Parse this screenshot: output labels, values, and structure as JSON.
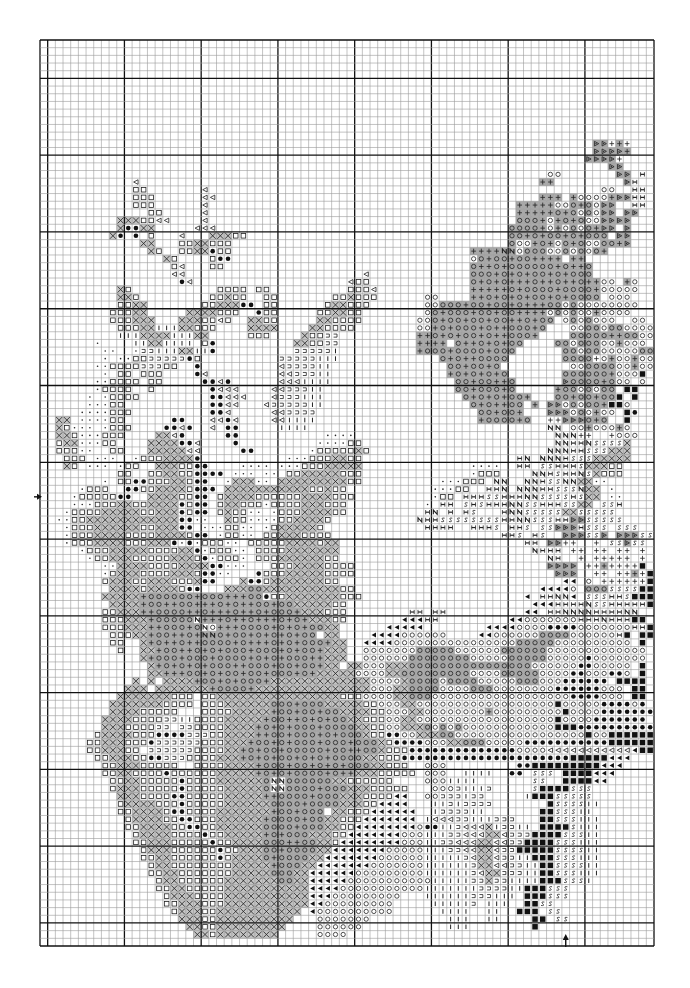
{
  "page": {
    "background": "#ffffff"
  },
  "chart_data": {
    "type": "cross-stitch-grid",
    "columns": 80,
    "rows_count": 118,
    "major_every": 10,
    "first_major_col_offset": 1,
    "first_major_row_offset": 5,
    "center_markers": [
      {
        "side": "left",
        "direction": "right",
        "row": 59
      },
      {
        "side": "bottom",
        "direction": "up",
        "col": 68
      }
    ],
    "colors": {
      "grid_minor": "#9a9a9a",
      "grid_major": "#111111",
      "shade": "#a8a8a8",
      "ink": "#222222"
    },
    "legend": {
      ".": {
        "symbol": "empty",
        "shaded": false
      },
      "x": {
        "symbol": "x-in-box",
        "shaded": true
      },
      "q": {
        "symbol": "open-square",
        "shaded": false
      },
      "d": {
        "symbol": "left-triangle-outline",
        "shaded": false
      },
      "b": {
        "symbol": "filled-dot",
        "shaded": false
      },
      "o": {
        "symbol": "open-circle",
        "shaded": false
      },
      "O": {
        "symbol": "open-circle",
        "shaded": true
      },
      "+": {
        "symbol": "plus",
        "shaded": true
      },
      "p": {
        "symbol": "plus",
        "shaded": false
      },
      "n": {
        "symbol": "letter-N",
        "shaded": false
      },
      "N": {
        "symbol": "letter-N",
        "shaded": true
      },
      "s": {
        "symbol": "letter-S",
        "shaded": false
      },
      "t": {
        "symbol": "small-dot",
        "shaded": false
      },
      "i": {
        "symbol": "vertical-bar",
        "shaded": false
      },
      "c": {
        "symbol": "hook",
        "shaded": false
      },
      "e": {
        "symbol": "filled-left-triangle",
        "shaded": false
      },
      "m": {
        "symbol": "filled-square",
        "shaded": false
      },
      "D": {
        "symbol": "right-triangle-dot",
        "shaded": true
      },
      "h": {
        "symbol": "letter-H",
        "shaded": false
      }
    },
    "rows": [
      "................................................................................",
      "................................................................................",
      "................................................................................",
      "................................................................................",
      "................................................................................",
      "................................................................................",
      "................................................................................",
      "................................................................................",
      "................................................................................",
      "................................................................................",
      "................................................................................",
      "................................................................................",
      "................................................................................",
      "........................................................................DDp+p...",
      "........................................................................DDDD+...",
      ".......................................................................DDDDp....",
      "..........................................................................DD....",
      "..................................................................oo.......DD.h.",
      "............d....................................................++.........Dh.",
      "............qq.......d...................................................oo..hh.",
      "............qqq......dd..........................................+++.+oooo+DDhh",
      "............qqq......d........................................+++++ooO+OoDD..hh",
      "..............qq.....d........................................+++++O+OoOoDD.DD.",
      "..........xxxqqdd....d........................................OOO+o+O+OooDDDD..",
      "..........xbbxx.....ddd......................................OOOO+o+oOoO+DD.D..",
      ".........xb.b.q...d...xxxqq..................................OO+O+OO+O+OOO.DD..",
      ".............xx...qqxxqqq....................................Ooo+O+oO+OooOO+D..",
      "..............xq..qqxxbqq...............................++++NNoOOOooOoOoO+...",
      "................xq....qbb...............................oO+OO+OO++++.++........",
      ".................qd...qq................................O++O+OOOOOO+O++O.......",
      ".................dd.......................d.............OOO+O+O+OO+O+OOO.......",
      "..................bd....................dqq.............O+O+O+++O++O++O++oo.+o.",
      "..........xq...........qqqq.qq..........qqqd............+++++O+OOOO+OOOO+ooooo..",
      "..........xxq.........qqxqq..qq.......qqxqqq......oo....++O+O+O+OO+O+OOOO.ooo...",
      "..........qqxx.......qqxxxbb.qq......qxxqqq.......ooOOO+OO+OO+O+++OOoOoooooooo..",
      ".........qqqxx.....xxxxqqq..bqq.....qqxxqq........oO+OOO+OO+OO++++oOoOoo+oooo...",
      ".........qqqxxx...xxxqqdq..xxqq.....xxqqqq.......ooO+OO+OO+OO++O+OO.oOoOooo..oo.",
      "..........qqqxxiiixxqqq....xxxx....xxqqqq........oo+O+OOO+O++OOO+O...ooOOoOOoooo",
      "..........iiixxxxiiixx.....qqq....xqqcc..........++O+O+OO+O++OOO+....OOOOO++OOoo",
      ".......t....iixxiiii.qb..........xxqqcc..........++++.O++O+O+OO....OOoOOOoo+ooo",
      "........tt..tcciiixxiib..........ccccci..........+OOO+OOOO+OOO......OOoOOoooooOO",
      "........t.ttqqcccccbq..........ccccciii.............O+O++OOOO.......OOOOpo+oo+oo",
      ".......ttqqqqcccqq..b..........dccccii...............OO+OO+O.........ooOOOOoo+oo",
      "........t.qq.qqq....bd.........ddcccii...............+O+O+O+O.......OOOOOO+ooom",
      ".......ttqqqq.qq.....bbdb......dddiiii................OO+OO++O......DOOOO+Ooo.o",
      ".......tqqqq..q.......bddd....ddcccii.................OO+OOO+O.....+OOoOoOO.mm",
      "......t.tqqqq.........bbddd...dccciii..................O+O+O+OO+...OO+OO+OOm.m",
      "......tttqq...........bbdd...dcccccii...................O+O++OO.+.DDoOoOO+mmo",
      ".....ttttqqq..........bbd.....ddcccc.....................OO+OO+...DDDoOo+oo.mb",
      "..xx.ttttqq......bb...ddbd....ddiiii.....................+OOOO+O..ppDDDO+O..m.",
      "..xqttt.tqqq....bbdb..d.bb.....iiii...............................nn.oo+ooo+o",
      "..xxqtttqqq....xxdb.....bb...........tttt..........................nnnpp..pooo",
      "..qxxtttqq....xxxxbbd....b..........ttttqq.........................nnhhnssssx",
      "..qqqtt..qq...xxxxxdd.....bb.......tqqqqqxq.......................nnnhhsssxxx",
      "...qqq.ttt..tqqqxxxxb...........tttqqqxxqq....................hn.nnnhsssxxxxx",
      "...xq.ttt.tqq..xxxqqbb....tttt.tttqqqxxxxx..............tttt..hh.sshhhsxxxqq",
      "..........qq..qqxxqqbbbb.ttt.tt.qqxxxxxqqq..............tqqq....nnhshhnsxqqq.",
      "........t.qqbbqqqxxqbb..txxxtt.xxxxxxxxxqq..........tttqqq.nn..nnhssnnxxtt.",
      ".....tqqq..bbqqxxxxqbbb.xxxxxxxxxxxqqxqq...........tttqq..hhn.nnnhhsssnxx.t",
      "....tqqqqqbb..xxxxqqbb.qxxxxqqqqqqxxxxqqq..........tqq.hhhsshhhnnsssshsxx.tt",
      "....tttqqqxxqqxxxxbqbb.qxxqqqtqqqqxxxqqq..........t.hh.shshhhnnsshhhssxx.ssh",
      "...tqqqqxxxxxqqxxxbqbb.qxqqtt.tqqqxxxxqq..........hn.h.hs...hnnsssssxxsssss",
      "..ttqqxxxxxxxxxxxxbbtt..xqqttttqqxxxxq...........nhhsssssssshhnnssshhDDsssss",
      "...tqqqxxxxxxqqxxxbb.tttqqtt.tqxxxxxq.............hhhh..hhhs.hhs.ssDDDhsss.sss",
      "...tqqqxxxxqqqqxxxxqbb.tqqtt.qqxxxqqqq......................hhs.hs..DDDssD.DDDss",
      "...tqqqxxxxqqqxxxbtbtqqqtt.qqqqqxxxxqxx........................hh.DDpp..p.ssDss",
      ".....tqqqxxxxxqqqqxxbtqqqtt.qqqqxxxxxxx.........................nhhh.pp.pp.pp.p",
      "......tqqxxxqqqqqxxxqbtqqqt.qqqxxxxxxqq...........................nh..p.ppppp.p",
      "........ttxxxxqqqqxxxxbbttt...qqqxxxxqqqq.........................DDDD.pp+ppppm",
      "........tqxxxqqqqxxxqbbtt...bqqqxxxxxqqqq..........................DDD..pp.pp+pm",
      "........qxxxqqxxxqqqxbb...xbbqxxxxxxxqq.............................ee.o.ppppppm",
      ".........xxxxqxxxxqbb...xxxOOxxxxxxxxxxqq........................eeeeo.OOOssssmm",
      "........xxxxx+OOOOOO+OOO+++OObqqxxxxxxxqqq.....................e.hhnne.ssshhsmmm",
      ".........xxxx+OO++OO+++O+O++OO+OOxxxxxqq........................eeehhhhnsshhhhhm",
      "........qqxxx++OOOO++O+++O++O+OOO+xxxqqq........hh.hh..........ee.hhnnnnhhhhnn",
      "........qqqxxx+OOOOOn+++O++O+++O+O+xxxqq.......eeehh.........eeooooooohhhnhhhmm",
      "........qqqxxx++OOO+Ono+++OOOO+O+O+OOxx......eeeee........eeeeoooobbbbooooooohhmm",
      ".........qqqxx+OO++O+NNO+OO+O+O+O+OO.xx....eeeeoooooo....eeooooooOOOOoooooohm.mm",
      ".........qq..x+O++O++OOOO+O+++O+O+OOO+xx..eeeeooooooooooooooooOOOOOoooooooooo.m",
      "..........q..xx+OO++O+O+OOO+OOO+O+OO+xxx..oooooooOOOOOooooooOOOOOOooooooooooooo",
      ".............x+OOO+OOO+OOOO+O+O+OOO++xxx..ooooooOOOOOOOOoooooOOOOOooooobooooooo",
      "..............x+O+O+O+OOO++OOO+OO+OO+xx.xxoooxxxOOOOOOOOOOOOOOOOoooooobbooooo.m",
      "..............xx+++OO+O+OO+OO+OOO+O+xxxxxooooxxOOOOOOOOOooooOOOOOoooobbooobbo.m",
      "............x.x.xxxx+OO+O+OOO+xxxxxxxxxxxxxooooxOOOOoOOOOoooooOOOooobbbbbb.mmmm",
      "...........xxx.xxxxxxx+OOOO+xxxxxxxxxxxxxxxoooxxOOOOooooOOOoooooooobbbbbbooo.mm",
      "..........xxxxxxxqqq.qqxxxxxxxxxxxxxxxxqqqooooxxOOOoooooooooooooooooobbbbooo.mm",
      ".........xxxxxxxqqqq.qqqxxxxxxOOO+OOOxxxxxqqoooxxoooooooooooooooooomooooobbbbob",
      ".........xxxxqqqqq...qqqqxxxxx+OO+OO+OOxxxxqqoooxxoooooooo+ooooooooomoooobbbbbbb",
      "........xxxxqqqqcciiqqqqxxxxx+OO++O+O+OOxxqqqooxxoooooooooooooooooomoooobbbbbbb",
      "........xxxqqqqcc.ccqqqqxxxx+O+O+OOO+OOOOxxqqooxxxOoOoOoooooooooooommmbbbbbbbbbb",
      ".......qxxxxqqqbbbbcccqqxxxx++OO+OOO+O+OOOxqqbbooxxxOOooooooooooooooooomoommmmmmm",
      "......qqxxxqqqbccccccqqqxxx+OO+O+OOO+OOO+OOOxqbbbboooxxOOOooooobbbbbbbbbbbmmmmmmm",
      "......qqxxxqq.ccccccqqqqxx+O+OO+OOOOO+OO++OOxqqqbbbbbbbbbbbbbboooodddddddddddemm",
      ".......qqxxxqqbbcccqqqqxxx+O+O+OO+O+O+OOOOxxqqqbbbbbbbbbbbbbbbbbbbbbbmmmmmeee",
      "........qqxxxqqqqq..qqqqxxxx+OOO+OO+O+O+OOOxxqqq..ooo.........bbmmmmmmmmmeee",
      "........qqxxqqqqbqqqqqqxxxxx+O+O+OOOO+O++xxxqqqqq.ooo..iiii..bb.sss.mmmmeee",
      ".........qqxxqqqqqbqqqqxxxxxxOnnOOOOOOxxqqqqqq....oooiiii.......ss..mmmmee",
      ".........qxxxqqqqqbqqqqqxxxxxOnnOOOO+OOOxxxqqqqq...ooociiic.....smmmmsss",
      "..........xxxqqqqbbqqqqqxxxxx++OOOO+OOOxxxqqqqee..oocccicc.....immmsssss",
      "..........qxxxxqqqbqqqqqxxxxxxOOOO+OOOOxxxqqeeee...iicicccc.......mssssii",
      "..........qqxxxxqbbqqqqxxxxxxx+OO+OOO.xxqqqeeeeee..iccccii.......mmsssii",
      "...........qxxxxqqbbqqqxxxxxx+OOOO+OOxxqqqeeeeeee.idddcciiiccc...mmsssiii",
      "...........qqxxxxqqbbqqxxxxxxOOOO+OOOxxqqeeeeeeeeobbiicdddxiccii.mmmmsiii",
      "............qxxxxqqqqbqqxxxxx+O+OOOxxxqqeeeeeeeoooiiiccdddxxdcccmmmmsssii",
      "............qqxxxqqqqqbqqxxxxOOO++OOxxqeeeeeeeeoooiiccdddxxddccmmmmsssiii",
      ".............qxxxqqqqqqbqqxxxOO+OOOOxxeeeeeeeoooooiiiccddxxdccmmmmmssssii",
      ".............qqxxqqqqqqbqxxxxO+OOOOxxeeeeeeeooooooiiiiicdxxdcciimmmsssiii",
      "..............qxxqqqqqqqqxxxxx+OOOxxeeeeeeeoooooooiiiiiicxxddcciimmssssii",
      "..............qqxxqqqqqqqxxxxxOOOxxeeeeeeoooooooooiiiiiicdxxccciimmsssiii",
      "...............qxxqqqqqqxxxxxxxOOxxeeeeeoooooooooooiiiiiccxcciiiimmmsssi",
      "...............qqxxqqqqqxxxxxxxxxxxeeeeoooooooooooiiiiiiicccciimmmsss.",
      "................qxxxqqqqxxxxxxxxxxxeeeooooooooo...iiiiiiccciii.mmmsss",
      "................qqxxxqqqxxxxxxxxxxxeeooooooooo.....iiiiic.iii..mmss",
      ".................qxxxqqxxxxxxxxxxx.eoooooooooo......iiii..ii..mmm.ss",
      "..................xxxqqxxxxxxxxxx...ooooooo..........iii..ii....mm.ss",
      "...................xxqqxxxxxxxxx....oooooo...........iii........m...",
      "....................xxqxxxxxxxx.....oooo............................",
      "................................................................................"
    ]
  }
}
